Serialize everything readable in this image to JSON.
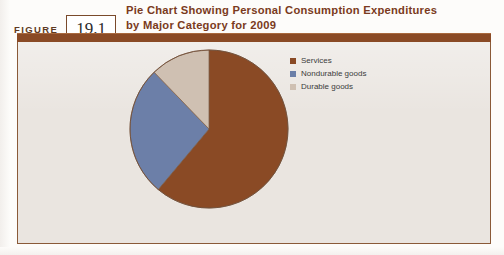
{
  "figure": {
    "label": "FIGURE",
    "number": "19.1"
  },
  "chart_title_line1": "Pie Chart Showing Personal Consumption Expenditures",
  "chart_title_line2": "by Major Category for 2009",
  "colors": {
    "services": "#8a4a25",
    "nondurable_goods": "#6c7fa8",
    "durable_goods": "#cfc0b2",
    "frame_brown": "#8a5a38",
    "title_brown": "#7a3a20",
    "panel_bg": "#eae5e0"
  },
  "chart_data": {
    "type": "pie",
    "title": "Pie Chart Showing Personal Consumption Expenditures by Major Category for 2009",
    "labels": [
      "Services",
      "Nondurable goods",
      "Durable goods"
    ],
    "values": [
      61,
      27,
      12
    ],
    "unit": "percent",
    "colors": [
      "#8a4a25",
      "#6c7fa8",
      "#cfc0b2"
    ],
    "start_angle_deg": 0,
    "direction": "clockwise",
    "legend_position": "right",
    "grid": false,
    "data_labels_shown": false,
    "slices": [
      {
        "label": "Services",
        "value": 61,
        "sweep_deg": 220,
        "color": "#8a4a25"
      },
      {
        "label": "Nondurable goods",
        "value": 27,
        "sweep_deg": 96,
        "color": "#6c7fa8"
      },
      {
        "label": "Durable goods",
        "value": 12,
        "sweep_deg": 44,
        "color": "#cfc0b2"
      }
    ]
  },
  "legend": {
    "items": [
      {
        "label": "Services",
        "color": "#8a4a25"
      },
      {
        "label": "Nondurable goods",
        "color": "#6c7fa8"
      },
      {
        "label": "Durable goods",
        "color": "#cfc0b2"
      }
    ]
  }
}
